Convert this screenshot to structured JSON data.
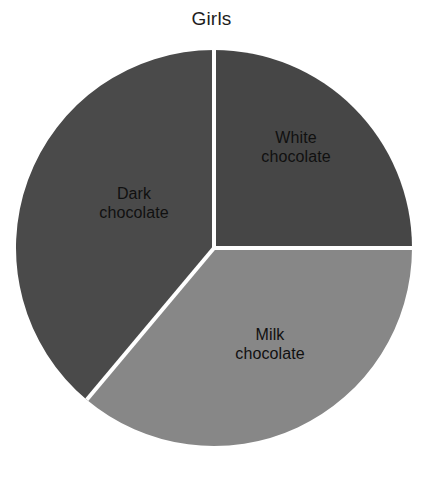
{
  "chart_data": {
    "type": "pie",
    "title": "Girls",
    "subtitle": "",
    "xlabel": "",
    "ylabel": "",
    "legend_position": "none",
    "grid": false,
    "labels_inside_slices": true,
    "start_angle_deg": 0,
    "direction": "clockwise",
    "categories": [
      "White chocolate",
      "Milk chocolate",
      "Dark chocolate"
    ],
    "values": [
      25,
      36,
      39
    ],
    "value_unit": "percent",
    "slices": [
      {
        "name": "White chocolate",
        "label_line1": "White",
        "label_line2": "chocolate",
        "value": 25,
        "start_angle_deg": 0,
        "end_angle_deg": 90,
        "color": "#464646"
      },
      {
        "name": "Milk chocolate",
        "label_line1": "Milk",
        "label_line2": "chocolate",
        "value": 36,
        "start_angle_deg": 90,
        "end_angle_deg": 220,
        "color": "#878787"
      },
      {
        "name": "Dark chocolate",
        "label_line1": "Dark",
        "label_line2": "chocolate",
        "value": 39,
        "start_angle_deg": 220,
        "end_angle_deg": 360,
        "color": "#4a4a4a"
      }
    ],
    "colors": {
      "white_chocolate": "#464646",
      "milk_chocolate": "#878787",
      "dark_chocolate": "#4a4a4a",
      "divider": "#ffffff",
      "background": "#ffffff",
      "label_text": "#101010",
      "title_text": "#1d1d1d"
    },
    "geometry": {
      "center_x": 200,
      "center_y": 200,
      "radius": 198,
      "divider_width": 4
    }
  }
}
